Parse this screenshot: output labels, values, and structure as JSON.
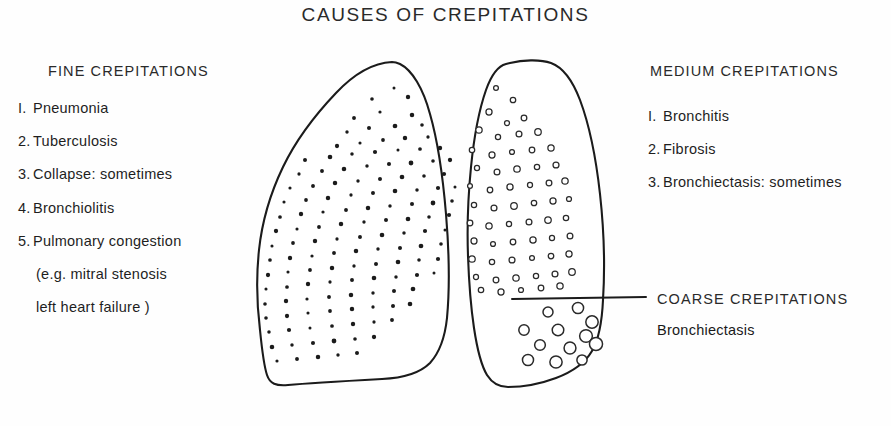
{
  "title": "CAUSES OF CREPITATIONS",
  "fine": {
    "heading": "FINE CREPITATIONS",
    "items": [
      {
        "num": "I.",
        "label": "Pneumonia"
      },
      {
        "num": "2.",
        "label": "Tuberculosis"
      },
      {
        "num": "3.",
        "label": "Collapse: sometimes"
      },
      {
        "num": "4.",
        "label": "Bronchiolitis"
      },
      {
        "num": "5.",
        "label": "Pulmonary congestion"
      }
    ],
    "sub_lines": [
      "(e.g. mitral stenosis",
      "left heart failure )"
    ]
  },
  "medium": {
    "heading": "MEDIUM CREPITATIONS",
    "items": [
      {
        "num": "I.",
        "label": "Bronchitis"
      },
      {
        "num": "2.",
        "label": "Fibrosis"
      },
      {
        "num": "3.",
        "label": "Bronchiectasis: sometimes"
      }
    ]
  },
  "coarse": {
    "heading": "COARSE CREPITATIONS",
    "item": "Bronchiectasis"
  },
  "colors": {
    "ink": "#1b1b1b",
    "background": "#fefefe"
  },
  "diagram": {
    "left_lung_name": "left-lung-fine-crepitations",
    "right_lung_name": "right-lung-medium-coarse-crepitations",
    "divider_name": "coarse-crepitations-pointer-line",
    "left_lung_path": "M 392 62 C 372 63 352 76 336 93 C 316 114 296 140 283 167 C 270 194 262 222 259 250 C 256 278 257 306 260 330 C 262 350 264 366 267 375 C 270 384 276 386 288 385 C 310 383 346 381 382 379 C 404 378 420 373 430 363 C 440 352 445 337 447 318 C 450 286 449 250 446 214 C 443 178 438 142 430 114 C 423 88 412 70 400 64 C 397 62.6 394.5 62 392 62 Z",
    "right_lung_path": "M 506 64 C 498 66 491 76 486 90 C 479 110 474 137 471 167 C 468 197 467 228 468 256 C 469 284 471 308 474 328 C 477 348 481 365 487 375 C 492 383 499 387 508 387 C 522 387 540 384 556 378 C 572 372 585 363 592 351 C 599 339 602 322 603 300 C 605 268 604 230 600 194 C 596 158 589 124 580 100 C 572 79 562 67 551 63 C 540 59 522 60 510 63 Z",
    "divider": {
      "x1": 512,
      "y1": 299,
      "x2": 646,
      "y2": 297
    },
    "fine_dots": [
      [
        394,
        88
      ],
      [
        372,
        99
      ],
      [
        408,
        97
      ],
      [
        380,
        112
      ],
      [
        354,
        118
      ],
      [
        412,
        115
      ],
      [
        347,
        132
      ],
      [
        369,
        128
      ],
      [
        395,
        126
      ],
      [
        422,
        125
      ],
      [
        337,
        146
      ],
      [
        360,
        143
      ],
      [
        383,
        140
      ],
      [
        405,
        138
      ],
      [
        428,
        137
      ],
      [
        305,
        160
      ],
      [
        330,
        157
      ],
      [
        352,
        154
      ],
      [
        375,
        152
      ],
      [
        398,
        150
      ],
      [
        420,
        149
      ],
      [
        440,
        148
      ],
      [
        299,
        174
      ],
      [
        322,
        171
      ],
      [
        344,
        169
      ],
      [
        367,
        166
      ],
      [
        389,
        164
      ],
      [
        411,
        163
      ],
      [
        433,
        161
      ],
      [
        450,
        160
      ],
      [
        290,
        188
      ],
      [
        313,
        186
      ],
      [
        335,
        183
      ],
      [
        358,
        181
      ],
      [
        380,
        179
      ],
      [
        402,
        177
      ],
      [
        424,
        176
      ],
      [
        444,
        174
      ],
      [
        284,
        202
      ],
      [
        306,
        200
      ],
      [
        328,
        198
      ],
      [
        351,
        195
      ],
      [
        373,
        193
      ],
      [
        395,
        191
      ],
      [
        417,
        190
      ],
      [
        438,
        188
      ],
      [
        455,
        187
      ],
      [
        280,
        217
      ],
      [
        301,
        214
      ],
      [
        323,
        212
      ],
      [
        346,
        210
      ],
      [
        368,
        208
      ],
      [
        390,
        206
      ],
      [
        412,
        204
      ],
      [
        433,
        203
      ],
      [
        452,
        201
      ],
      [
        276,
        231
      ],
      [
        297,
        229
      ],
      [
        319,
        227
      ],
      [
        341,
        224
      ],
      [
        364,
        222
      ],
      [
        386,
        220
      ],
      [
        408,
        219
      ],
      [
        429,
        217
      ],
      [
        449,
        215
      ],
      [
        272,
        246
      ],
      [
        293,
        243
      ],
      [
        315,
        241
      ],
      [
        337,
        239
      ],
      [
        360,
        237
      ],
      [
        382,
        235
      ],
      [
        404,
        233
      ],
      [
        425,
        231
      ],
      [
        445,
        230
      ],
      [
        270,
        260
      ],
      [
        290,
        258
      ],
      [
        312,
        256
      ],
      [
        334,
        253
      ],
      [
        356,
        251
      ],
      [
        378,
        249
      ],
      [
        400,
        248
      ],
      [
        421,
        246
      ],
      [
        441,
        244
      ],
      [
        268,
        275
      ],
      [
        288,
        272
      ],
      [
        310,
        270
      ],
      [
        332,
        268
      ],
      [
        354,
        266
      ],
      [
        376,
        264
      ],
      [
        398,
        262
      ],
      [
        419,
        260
      ],
      [
        438,
        259
      ],
      [
        266,
        289
      ],
      [
        287,
        287
      ],
      [
        308,
        284
      ],
      [
        330,
        282
      ],
      [
        352,
        280
      ],
      [
        374,
        278
      ],
      [
        396,
        277
      ],
      [
        417,
        275
      ],
      [
        434,
        273
      ],
      [
        265,
        304
      ],
      [
        286,
        301
      ],
      [
        307,
        299
      ],
      [
        329,
        297
      ],
      [
        351,
        295
      ],
      [
        373,
        293
      ],
      [
        394,
        291
      ],
      [
        413,
        289
      ],
      [
        266,
        318
      ],
      [
        287,
        316
      ],
      [
        308,
        313
      ],
      [
        330,
        311
      ],
      [
        352,
        309
      ],
      [
        373,
        307
      ],
      [
        393,
        306
      ],
      [
        410,
        304
      ],
      [
        269,
        332
      ],
      [
        289,
        330
      ],
      [
        310,
        328
      ],
      [
        332,
        326
      ],
      [
        353,
        324
      ],
      [
        374,
        322
      ],
      [
        392,
        320
      ],
      [
        272,
        347
      ],
      [
        292,
        345
      ],
      [
        313,
        343
      ],
      [
        334,
        341
      ],
      [
        355,
        339
      ],
      [
        374,
        337
      ],
      [
        277,
        361
      ],
      [
        297,
        359
      ],
      [
        318,
        357
      ],
      [
        338,
        355
      ],
      [
        357,
        353
      ]
    ],
    "medium_circles": [
      [
        496,
        88
      ],
      [
        513,
        100
      ],
      [
        489,
        112
      ],
      [
        507,
        123
      ],
      [
        524,
        118
      ],
      [
        479,
        130
      ],
      [
        498,
        137
      ],
      [
        519,
        134
      ],
      [
        538,
        132
      ],
      [
        472,
        150
      ],
      [
        492,
        155
      ],
      [
        512,
        152
      ],
      [
        532,
        150
      ],
      [
        551,
        148
      ],
      [
        477,
        168
      ],
      [
        497,
        172
      ],
      [
        517,
        169
      ],
      [
        537,
        167
      ],
      [
        556,
        165
      ],
      [
        470,
        186
      ],
      [
        490,
        190
      ],
      [
        510,
        187
      ],
      [
        530,
        185
      ],
      [
        549,
        183
      ],
      [
        565,
        181
      ],
      [
        474,
        205
      ],
      [
        494,
        208
      ],
      [
        514,
        206
      ],
      [
        534,
        203
      ],
      [
        553,
        201
      ],
      [
        569,
        199
      ],
      [
        470,
        223
      ],
      [
        489,
        226
      ],
      [
        509,
        224
      ],
      [
        529,
        222
      ],
      [
        548,
        220
      ],
      [
        566,
        218
      ],
      [
        474,
        241
      ],
      [
        493,
        244
      ],
      [
        513,
        242
      ],
      [
        533,
        240
      ],
      [
        552,
        238
      ],
      [
        570,
        236
      ],
      [
        472,
        259
      ],
      [
        492,
        262
      ],
      [
        512,
        260
      ],
      [
        532,
        258
      ],
      [
        551,
        256
      ],
      [
        569,
        254
      ],
      [
        476,
        277
      ],
      [
        496,
        280
      ],
      [
        516,
        278
      ],
      [
        536,
        276
      ],
      [
        555,
        274
      ],
      [
        572,
        272
      ],
      [
        481,
        290
      ],
      [
        501,
        292
      ],
      [
        521,
        290
      ],
      [
        541,
        288
      ],
      [
        560,
        286
      ]
    ],
    "coarse_circles": [
      [
        548,
        312
      ],
      [
        578,
        308
      ],
      [
        592,
        322
      ],
      [
        524,
        330
      ],
      [
        558,
        330
      ],
      [
        586,
        336
      ],
      [
        540,
        345
      ],
      [
        570,
        348
      ],
      [
        596,
        344
      ],
      [
        528,
        360
      ],
      [
        556,
        362
      ],
      [
        582,
        360
      ]
    ]
  }
}
